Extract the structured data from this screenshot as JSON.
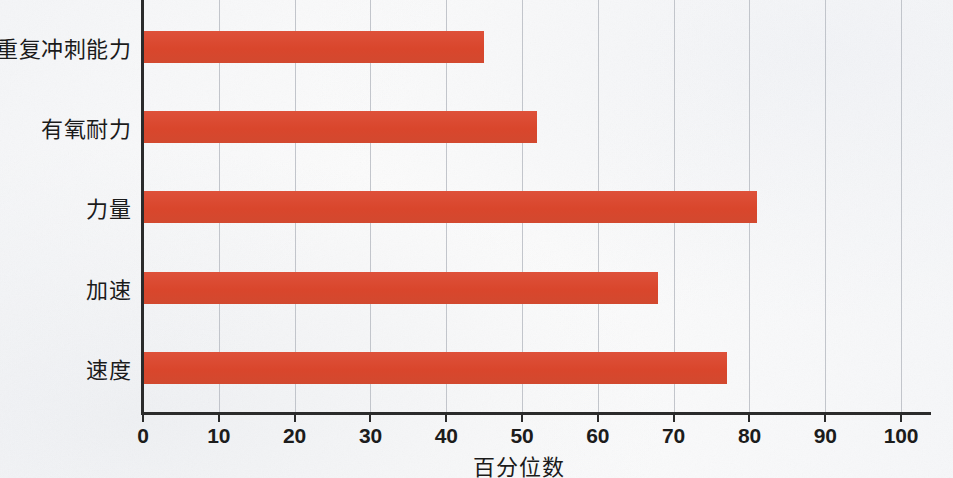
{
  "chart_data": {
    "type": "bar",
    "orientation": "horizontal",
    "title": "",
    "subtitle": "",
    "xlabel": "百分位数",
    "ylabel": "",
    "categories": [
      "速度",
      "加速",
      "力量",
      "有氧耐力",
      "重复冲刺能力"
    ],
    "values": [
      77,
      68,
      81,
      52,
      45
    ],
    "series": [
      {
        "name": "百分位数",
        "values": [
          77,
          68,
          81,
          52,
          45
        ]
      }
    ],
    "xlim": [
      0,
      100
    ],
    "xticks": [
      0,
      10,
      20,
      30,
      40,
      50,
      60,
      70,
      80,
      90,
      100
    ],
    "xtick_labels": [
      "0",
      "10",
      "20",
      "30",
      "40",
      "50",
      "60",
      "70",
      "80",
      "90",
      "100"
    ],
    "grid": {
      "vertical": true,
      "horizontal": false
    },
    "legend": {
      "visible": false,
      "position": "none"
    },
    "colors": {
      "bar": "#DD4C33",
      "axis": "#2B2B2B",
      "gridline": "#B9BCC3",
      "background": "#FBFBFB",
      "text": "#1B1B1B"
    }
  },
  "bars": [
    {
      "label": "重复冲刺能力",
      "value": 45
    },
    {
      "label": "有氧耐力",
      "value": 52
    },
    {
      "label": "力量",
      "value": 81
    },
    {
      "label": "加速",
      "value": 68
    },
    {
      "label": "速度",
      "value": 77
    }
  ],
  "axis": {
    "x_title": "百分位数",
    "ticks": [
      "0",
      "10",
      "20",
      "30",
      "40",
      "50",
      "60",
      "70",
      "80",
      "90",
      "100"
    ]
  }
}
